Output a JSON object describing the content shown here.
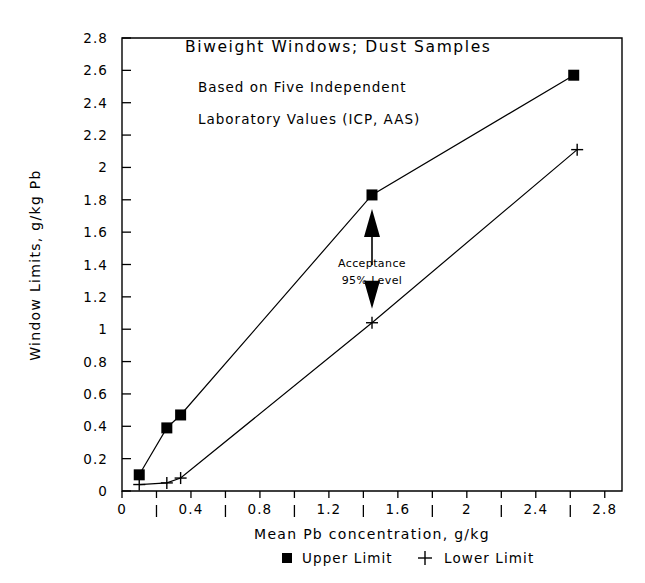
{
  "chart_data": {
    "type": "line",
    "title": "Biweight Windows; Dust Samples",
    "subtitle_line1": "Based on Five Independent",
    "subtitle_line2": "Laboratory Values (ICP, AAS)",
    "xlabel": "Mean Pb concentration, g/kg",
    "ylabel": "Window Limits, g/kg Pb",
    "xlim": [
      0,
      2.9
    ],
    "ylim": [
      0,
      2.8
    ],
    "grid": false,
    "legend_position": "bottom",
    "xticks": [
      0,
      0.4,
      0.8,
      1.2,
      1.6,
      2,
      2.4,
      2.8
    ],
    "xtick_labels": [
      "0",
      "0.4",
      "0.8",
      "1.2",
      "1.6",
      "2",
      "2.4",
      "2.8"
    ],
    "xtick_minor": [
      0.2,
      0.6,
      1.0,
      1.4,
      1.8,
      2.2,
      2.6
    ],
    "yticks": [
      0,
      0.2,
      0.4,
      0.6,
      0.8,
      1,
      1.2,
      1.4,
      1.6,
      1.8,
      2,
      2.2,
      2.4,
      2.6,
      2.8
    ],
    "ytick_labels": [
      "0",
      "0.2",
      "0.4",
      "0.6",
      "0.8",
      "1",
      "1.2",
      "1.4",
      "1.6",
      "1.8",
      "2",
      "2.2",
      "2.4",
      "2.6",
      "2.8"
    ],
    "series": [
      {
        "name": "Upper Limit",
        "marker": "square",
        "x": [
          0.1,
          0.26,
          0.34,
          1.45,
          2.62
        ],
        "values": [
          0.1,
          0.39,
          0.47,
          1.83,
          2.57
        ]
      },
      {
        "name": "Lower Limit",
        "marker": "plus",
        "x": [
          0.1,
          0.26,
          0.34,
          1.45,
          2.64
        ],
        "values": [
          0.04,
          0.05,
          0.08,
          1.04,
          2.11
        ]
      }
    ],
    "annotations": [
      {
        "text_line1": "Acceptance",
        "text_line2": "95% Level",
        "x": 1.45,
        "y_top": 1.83,
        "y_bottom": 1.04
      }
    ]
  },
  "legend": {
    "entries": [
      {
        "label": "Upper Limit",
        "marker": "square"
      },
      {
        "label": "Lower Limit",
        "marker": "plus"
      }
    ]
  },
  "colors": {
    "ink": "#000000",
    "paper": "#ffffff"
  }
}
